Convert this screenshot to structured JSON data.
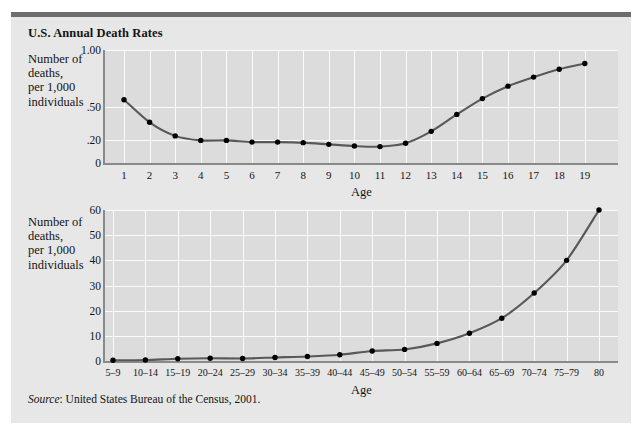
{
  "figure": {
    "title": "U.S. Annual Death Rates",
    "source_label": "Source",
    "source_separator": ": ",
    "source_text": "United States Bureau of the Census, 2001.",
    "background_color": "#e7e7e7",
    "plot_color": "#dcdcdc",
    "rule_color": "#6d6d6d",
    "line_color": "#55595c",
    "marker_color": "#000000"
  },
  "chart_data": [
    {
      "type": "line",
      "id": "death-rates-ages-1-19",
      "title": "U.S. Annual Death Rates",
      "xlabel": "Age",
      "ylabel": "Number of\ndeaths,\nper 1,000\nindividuals",
      "categories": [
        "1",
        "2",
        "3",
        "4",
        "5",
        "6",
        "7",
        "8",
        "9",
        "10",
        "11",
        "12",
        "13",
        "14",
        "15",
        "16",
        "17",
        "18",
        "19"
      ],
      "values": [
        0.56,
        0.36,
        0.24,
        0.2,
        0.2,
        0.185,
        0.185,
        0.18,
        0.165,
        0.15,
        0.145,
        0.175,
        0.28,
        0.43,
        0.57,
        0.68,
        0.76,
        0.83,
        0.88
      ],
      "ytick_labels": [
        "1.00",
        ".50",
        ".20",
        "0"
      ],
      "ytick_values": [
        1.0,
        0.5,
        0.2,
        0
      ],
      "ylim": [
        0,
        1.0
      ],
      "grid": true,
      "legend": "none"
    },
    {
      "type": "line",
      "id": "death-rates-age-groups",
      "title": "U.S. Annual Death Rates",
      "xlabel": "Age",
      "ylabel": "Number of\ndeaths,\nper 1,000\nindividuals",
      "categories": [
        "5–9",
        "10–14",
        "15–19",
        "20–24",
        "25–29",
        "30–34",
        "35–39",
        "40–44",
        "45–49",
        "50–54",
        "55–59",
        "60–64",
        "65–69",
        "70–74",
        "75–79",
        "80"
      ],
      "values": [
        0.3,
        0.4,
        0.9,
        1.1,
        1.0,
        1.4,
        1.8,
        2.5,
        4.0,
        4.6,
        7.0,
        11.0,
        17.0,
        27.0,
        40.0,
        60.0
      ],
      "ytick_labels": [
        "60",
        "50",
        "40",
        "30",
        "20",
        "10",
        "0"
      ],
      "ytick_values": [
        60,
        50,
        40,
        30,
        20,
        10,
        0
      ],
      "ylim": [
        0,
        60
      ],
      "grid": true,
      "legend": "none"
    }
  ]
}
